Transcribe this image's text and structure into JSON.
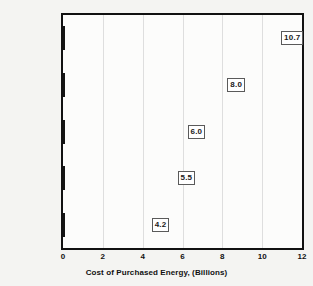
{
  "chart_data": {
    "type": "bar",
    "orientation": "horizontal",
    "title": "",
    "xlabel": "Cost of Purchased Energy, (Billions)",
    "ylabel": "",
    "categories": [
      "Chemicals",
      "Primary Metals",
      "Paper",
      "Food",
      "Petroleum"
    ],
    "values": [
      10.7,
      8.0,
      6.0,
      5.5,
      4.2
    ],
    "value_labels": [
      "10.7",
      "8.0",
      "6.0",
      "5.5",
      "4.2"
    ],
    "xlim": [
      0,
      12
    ],
    "xticks": [
      0,
      2,
      4,
      6,
      8,
      10,
      12
    ],
    "xtick_labels": [
      "0",
      "2",
      "4",
      "6",
      "8",
      "10",
      "12"
    ],
    "grid": "vertical",
    "legend": "none",
    "bar_color": "#808080",
    "bar_edge_color": "#141414",
    "plot_background": "#fcfcfb",
    "figure_background": "#f4f4f2",
    "axis_color": "#111111",
    "gridline_color": "#dedede"
  },
  "axis": {
    "x_title": "Cost of Purchased Energy, (Billions)"
  }
}
